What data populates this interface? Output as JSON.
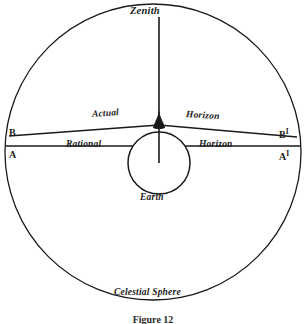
{
  "figure": {
    "caption": "Figure 12",
    "title": "Celestial Sphere"
  },
  "labels": {
    "zenith": "Zenith",
    "actual": "Actual",
    "horizon_actual": "Horizon",
    "rational": "Rational",
    "horizon_rational": "Horizon",
    "earth": "Earth",
    "celestial_sphere": "Celestial Sphere",
    "point_b": "B",
    "point_a": "A",
    "point_b_prime": "B",
    "point_a_prime": "A",
    "prime_symbol": "I"
  },
  "geometry": {
    "celestial_sphere": {
      "cx": 153,
      "cy": 152,
      "r": 148
    },
    "earth": {
      "cx": 159,
      "cy": 163,
      "r": 31
    },
    "observer": {
      "x": 159,
      "y": 124
    },
    "zenith_line": {
      "x1": 159,
      "y1": 17,
      "x2": 159,
      "y2": 163
    },
    "rational_horizon": {
      "x1": 6,
      "y1": 146,
      "x2": 300,
      "y2": 146
    },
    "actual_horizon_left": {
      "x1": 9,
      "y1": 136,
      "x2": 159,
      "y2": 125
    },
    "actual_horizon_right": {
      "x1": 159,
      "y1": 125,
      "x2": 297,
      "y2": 137
    }
  },
  "colors": {
    "ink": "#1a1a1a",
    "background": "#ffffff"
  }
}
